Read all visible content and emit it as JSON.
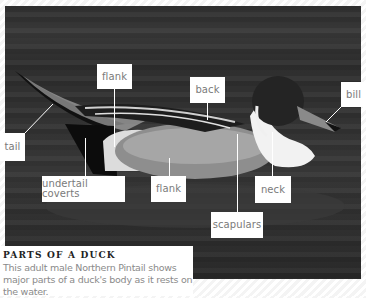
{
  "figure": {
    "labels": {
      "tail": "tail",
      "flank_upper": "flank",
      "back": "back",
      "bill": "bill",
      "undertail_coverts": "undertail coverts",
      "flank_lower": "flank",
      "neck": "neck",
      "scapulars": "scapulars"
    }
  },
  "caption": {
    "title": "PARTS OF A DUCK",
    "text": "This adult male Northern Pintail shows major parts of a duck's body as it rests on the water."
  },
  "colors": {
    "label_bg": "#ffffff",
    "label_text": "#7a7a7a",
    "photo_bg": "#303030",
    "caption_title": "#222222",
    "caption_text": "#8a8a8a"
  }
}
